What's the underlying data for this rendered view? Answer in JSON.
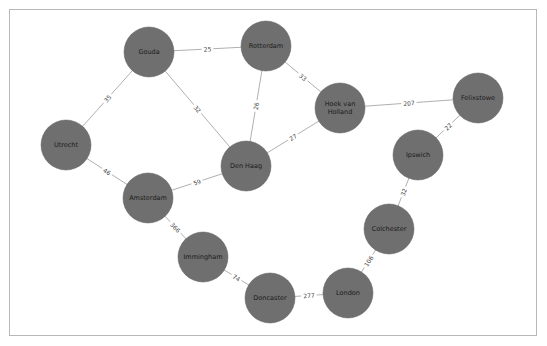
{
  "graph": {
    "node_color": "#6f6f6f",
    "edge_color": "#b0b0b0",
    "nodes": [
      {
        "id": "gouda",
        "label": "Gouda",
        "x": 149,
        "y": 52
      },
      {
        "id": "rotterdam",
        "label": "Rotterdam",
        "x": 266,
        "y": 46
      },
      {
        "id": "hoek",
        "label": "Hoek van Holland",
        "lines": [
          "Hoek van",
          "Holland"
        ],
        "x": 340,
        "y": 108
      },
      {
        "id": "felixstowe",
        "label": "Felixstowe",
        "x": 478,
        "y": 98
      },
      {
        "id": "utrecht",
        "label": "Utrecht",
        "x": 66,
        "y": 145
      },
      {
        "id": "denhaag",
        "label": "Den Haag",
        "x": 246,
        "y": 166
      },
      {
        "id": "ipswich",
        "label": "Ipswich",
        "x": 418,
        "y": 155
      },
      {
        "id": "amsterdam",
        "label": "Amsterdam",
        "x": 148,
        "y": 198
      },
      {
        "id": "immingham",
        "label": "Immingham",
        "x": 203,
        "y": 257
      },
      {
        "id": "colchester",
        "label": "Colchester",
        "x": 389,
        "y": 229
      },
      {
        "id": "doncaster",
        "label": "Doncaster",
        "x": 270,
        "y": 298
      },
      {
        "id": "london",
        "label": "London",
        "x": 348,
        "y": 293
      }
    ],
    "edges": [
      {
        "from": "gouda",
        "to": "rotterdam",
        "weight": "25"
      },
      {
        "from": "gouda",
        "to": "utrecht",
        "weight": "35"
      },
      {
        "from": "gouda",
        "to": "denhaag",
        "weight": "32"
      },
      {
        "from": "rotterdam",
        "to": "denhaag",
        "weight": "26"
      },
      {
        "from": "rotterdam",
        "to": "hoek",
        "weight": "33"
      },
      {
        "from": "hoek",
        "to": "denhaag",
        "weight": "27"
      },
      {
        "from": "hoek",
        "to": "felixstowe",
        "weight": "207"
      },
      {
        "from": "felixstowe",
        "to": "ipswich",
        "weight": "22"
      },
      {
        "from": "ipswich",
        "to": "colchester",
        "weight": "32"
      },
      {
        "from": "colchester",
        "to": "london",
        "weight": "106"
      },
      {
        "from": "london",
        "to": "doncaster",
        "weight": "277"
      },
      {
        "from": "doncaster",
        "to": "immingham",
        "weight": "74"
      },
      {
        "from": "immingham",
        "to": "amsterdam",
        "weight": "366"
      },
      {
        "from": "amsterdam",
        "to": "denhaag",
        "weight": "59"
      },
      {
        "from": "amsterdam",
        "to": "utrecht",
        "weight": "46"
      }
    ]
  }
}
